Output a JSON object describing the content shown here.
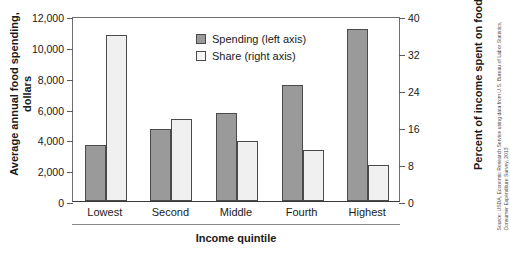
{
  "chart_data": {
    "type": "bar",
    "title": "",
    "categories": [
      "Lowest",
      "Second",
      "Middle",
      "Fourth",
      "Highest"
    ],
    "series": [
      {
        "name": "Spending (left axis)",
        "axis": "left",
        "unit": "dollars",
        "color": "#9a9a9a",
        "values": [
          3650,
          4700,
          5700,
          7550,
          11150
        ]
      },
      {
        "name": "Share (right axis)",
        "axis": "right",
        "unit": "percent",
        "color": "#f0f0f0",
        "values": [
          36.0,
          17.7,
          12.9,
          11.0,
          7.8
        ]
      }
    ],
    "xlabel": "Income quintile",
    "ylabel": "Average annual food spending, dollars",
    "ylabel_line1": "Average annual food spending,",
    "ylabel_line2": "dollars",
    "y2label": "Percent of income spent on food",
    "ylim": [
      0,
      12000
    ],
    "y2lim": [
      0,
      40
    ],
    "yticks": [
      "0",
      "2,000",
      "4,000",
      "6,000",
      "8,000",
      "10,000",
      "12,000"
    ],
    "ytick_values": [
      0,
      2000,
      4000,
      6000,
      8000,
      10000,
      12000
    ],
    "y2ticks": [
      "0",
      "8",
      "16",
      "24",
      "32",
      "40"
    ],
    "y2tick_values": [
      0,
      8,
      16,
      24,
      32,
      40
    ],
    "grid": false,
    "legend_position": "top-center",
    "legend": [
      "Spending (left axis)",
      "Share (right axis)"
    ]
  },
  "legend": {
    "spending_label": "Spending (left axis)",
    "share_label": "Share (right axis)"
  },
  "source": {
    "text": "Source: USDA, Economic Research Service using data from U.S. Bureau of Labor Statistics, Consumer Expenditure Survey, 2013"
  }
}
